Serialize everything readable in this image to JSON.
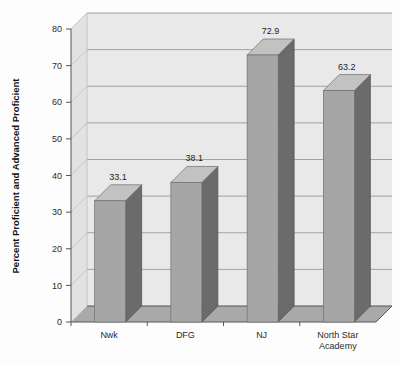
{
  "chart_data": {
    "type": "bar",
    "title": "",
    "subtitle": "",
    "xlabel": "",
    "ylabel": "Percent Proficient and Advanced Proficient",
    "categories": [
      "Nwk",
      "DFG",
      "NJ",
      "North Star Academy"
    ],
    "category_lines": [
      [
        "Nwk"
      ],
      [
        "DFG"
      ],
      [
        "NJ"
      ],
      [
        "North Star",
        "Academy"
      ]
    ],
    "values": [
      33.1,
      38.1,
      72.9,
      63.2
    ],
    "data_labels": [
      "33.1",
      "38.1",
      "72.9",
      "63.2"
    ],
    "ylim": [
      0,
      80
    ],
    "ytick_values": [
      0,
      10,
      20,
      30,
      40,
      50,
      60,
      70,
      80
    ],
    "ytick_labels": [
      "0",
      "10",
      "20",
      "30",
      "40",
      "50",
      "60",
      "70",
      "80"
    ],
    "grid": true,
    "grid_axis": "y",
    "legend": false,
    "legend_position": "none",
    "three_d": true,
    "colors": {
      "bar_front": "#a6a6a6",
      "bar_side": "#6b6b6b",
      "bar_top": "#c2c2c2",
      "panel_back": "#e9e9e9",
      "panel_side": "#e2e2e2",
      "panel_floor": "#a9a9a9",
      "gridline": "#9a9a9a",
      "axis": "#555555",
      "text": "#2b2b2b",
      "background": "#fdfdfd"
    }
  }
}
